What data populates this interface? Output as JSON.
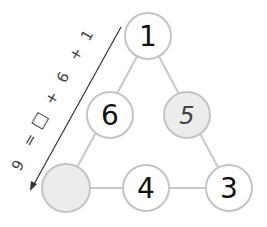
{
  "puzzle": {
    "type": "number-triangle",
    "nodes": [
      {
        "id": "top",
        "value": "1",
        "shaded": false,
        "handwritten": false
      },
      {
        "id": "mid-left",
        "value": "6",
        "shaded": false,
        "handwritten": false
      },
      {
        "id": "mid-right",
        "value": "5",
        "shaded": true,
        "handwritten": true
      },
      {
        "id": "bottom-left",
        "value": "",
        "shaded": true,
        "handwritten": false
      },
      {
        "id": "bottom-mid",
        "value": "4",
        "shaded": false,
        "handwritten": false
      },
      {
        "id": "bottom-right",
        "value": "3",
        "shaded": false,
        "handwritten": false
      }
    ],
    "annotation": {
      "tokens": [
        "1",
        "+",
        "6",
        "+",
        "□",
        "=",
        "9"
      ],
      "text": "1 + 6 + □ = 9"
    }
  }
}
